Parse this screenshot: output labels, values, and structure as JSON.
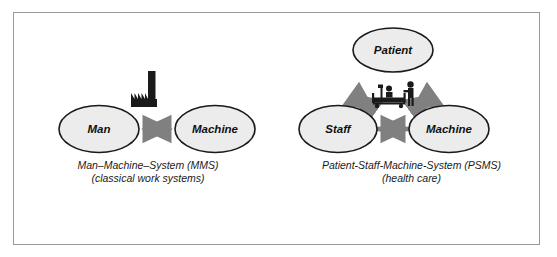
{
  "figure": {
    "background_color": "#ffffff",
    "border_color": "#9a9a9a",
    "ellipse_fill": "#ececec",
    "ellipse_stroke": "#1a1a1a",
    "arrow_color": "#808080",
    "icon_color": "#1a1a1a",
    "text_color": "#111111"
  },
  "panels": [
    {
      "id": "mms",
      "nodes": [
        {
          "id": "man",
          "label": "Man"
        },
        {
          "id": "machine",
          "label": "Machine"
        }
      ],
      "connections": [
        {
          "from": "Man",
          "to": "Machine",
          "style": "double-headed-arrow"
        }
      ],
      "icon": {
        "name": "factory-icon",
        "meaning": "factory"
      },
      "caption_line1": "Man–Machine–System (MMS)",
      "caption_line2": "(classical work systems)"
    },
    {
      "id": "psms",
      "nodes": [
        {
          "id": "patient",
          "label": "Patient"
        },
        {
          "id": "staff",
          "label": "Staff"
        },
        {
          "id": "machine",
          "label": "Machine"
        }
      ],
      "connections": [
        {
          "from": "Patient",
          "to": "Staff",
          "style": "double-headed-arrow"
        },
        {
          "from": "Patient",
          "to": "Machine",
          "style": "double-headed-arrow"
        },
        {
          "from": "Staff",
          "to": "Machine",
          "style": "double-headed-arrow"
        }
      ],
      "icon": {
        "name": "hospital-bed-icon",
        "meaning": "hospital bed with patient and caregiver"
      },
      "caption_line1": "Patient-Staff-Machine-System (PSMS)",
      "caption_line2": "(health care)"
    }
  ]
}
